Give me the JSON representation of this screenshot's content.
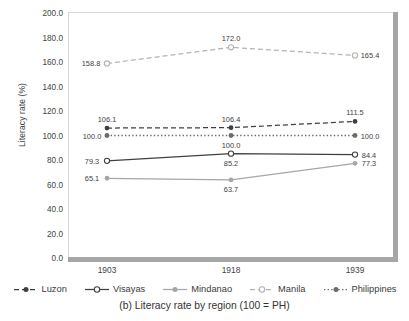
{
  "caption": "(b) Literacy rate by region (100 = PH)",
  "chart_data": {
    "type": "line",
    "title": "(b) Literacy rate by region (100 = PH)",
    "xlabel": "",
    "ylabel": "Literacy rate (%)",
    "categories": [
      "1903",
      "1918",
      "1939"
    ],
    "x": [
      1903,
      1918,
      1939
    ],
    "ylim": [
      0.0,
      200.0
    ],
    "yticks": [
      "0.0",
      "20.0",
      "40.0",
      "60.0",
      "80.0",
      "100.0",
      "120.0",
      "140.0",
      "160.0",
      "180.0",
      "200.0"
    ],
    "ytick_values": [
      0,
      20,
      40,
      60,
      80,
      100,
      120,
      140,
      160,
      180,
      200
    ],
    "grid": false,
    "legend_position": "bottom",
    "series": [
      {
        "name": "Luzon",
        "values": [
          106.1,
          106.4,
          111.5
        ],
        "labels": [
          "106.1",
          "106.4",
          "111.5"
        ],
        "color": "#3f3f3f",
        "line_style": "dashed",
        "marker": "filled-circle"
      },
      {
        "name": "Visayas",
        "values": [
          79.3,
          85.2,
          84.4
        ],
        "labels": [
          "79.3",
          "85.2",
          "84.4"
        ],
        "color": "#404040",
        "line_style": "solid",
        "marker": "open-circle"
      },
      {
        "name": "Mindanao",
        "values": [
          65.1,
          63.7,
          77.3
        ],
        "labels": [
          "65.1",
          "63.7",
          "77.3"
        ],
        "color": "#a6a6a6",
        "line_style": "solid",
        "marker": "filled-circle"
      },
      {
        "name": "Manila",
        "values": [
          158.8,
          172.0,
          165.4
        ],
        "labels": [
          "158.8",
          "172.0",
          "165.4"
        ],
        "color": "#b3b3b3",
        "line_style": "dashed",
        "marker": "open-circle"
      },
      {
        "name": "Philippines",
        "values": [
          100.0,
          100.0,
          100.0
        ],
        "labels": [
          "100.0",
          "100.0",
          "100.0"
        ],
        "color": "#6b6b6b",
        "line_style": "dotted",
        "marker": "filled-circle"
      }
    ]
  },
  "axes": {
    "y_title": "Literacy rate (%)",
    "y_labels": [
      "200.0",
      "180.0",
      "160.0",
      "140.0",
      "120.0",
      "100.0",
      "80.0",
      "60.0",
      "40.0",
      "20.0",
      "0.0"
    ],
    "x_labels": [
      "1903",
      "1918",
      "1939"
    ]
  },
  "legend": {
    "items": [
      {
        "label": "Luzon"
      },
      {
        "label": "Visayas"
      },
      {
        "label": "Mindanao"
      },
      {
        "label": "Manila"
      },
      {
        "label": "Philippines"
      }
    ]
  }
}
